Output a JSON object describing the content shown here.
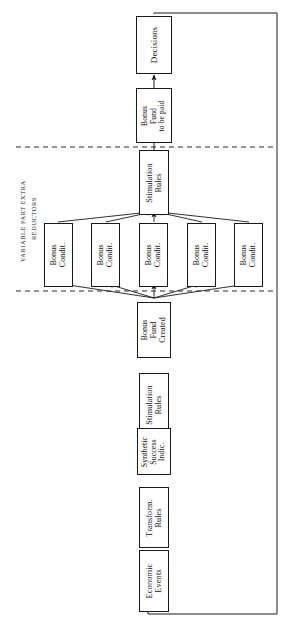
{
  "figure": {
    "orientation": "rotated-90-ccw",
    "background_color": "#ffffff",
    "line_color": "#1a1a1a"
  },
  "section_labels": [
    {
      "name": "variable-part-extra",
      "text": "VARIABLE PART EXTRA"
    },
    {
      "name": "reductors",
      "text": "REDUCTORS"
    }
  ],
  "nodes": {
    "economic_events": {
      "label": "Economic\nEvents",
      "lines": [
        "Economic",
        "Events"
      ]
    },
    "transform_rules": {
      "label": "Transform.\nRules",
      "lines": [
        "Transform.",
        "Rules"
      ]
    },
    "synthetic_success_indic": {
      "label": "Synthetic\nSuccess\nIndic.",
      "lines": [
        "Synthetic",
        "Success",
        "Indic."
      ]
    },
    "stimulation_rules_lower": {
      "label": "Stimulation\nRules",
      "lines": [
        "Stimulation",
        "Rules"
      ]
    },
    "bonus_fund_created": {
      "label": "Bonus\nFund\nCreated",
      "lines": [
        "Bonus",
        "Fund",
        "Created"
      ]
    },
    "bonus_condit_1": {
      "label": "Bonus\nCondit.",
      "lines": [
        "Bonus",
        "Condit."
      ]
    },
    "bonus_condit_2": {
      "label": "Bonus\nCondit.",
      "lines": [
        "Bonus",
        "Condit."
      ]
    },
    "bonus_condit_3": {
      "label": "Bonus\nCondit.",
      "lines": [
        "Bonus",
        "Condit."
      ]
    },
    "bonus_condit_4": {
      "label": "Bonus\nCondit.",
      "lines": [
        "Bonus",
        "Condit."
      ]
    },
    "bonus_condit_5": {
      "label": "Bonus\nCondit.",
      "lines": [
        "Bonus",
        "Condit."
      ]
    },
    "stimulation_rules_upper": {
      "label": "Stimulation\nRules",
      "lines": [
        "Stimulation",
        "Rules"
      ]
    },
    "bonus_fund_to_be_paid": {
      "label": "Bonus\nFund\nto be paid",
      "lines": [
        "Bonus",
        "Fund",
        "to be paid"
      ]
    },
    "decisions": {
      "label": "Decisions",
      "lines": [
        "Decisions"
      ]
    }
  },
  "chart_data": {
    "type": "diagram",
    "title": "",
    "subtype": "flowchart",
    "node_order": [
      "Economic Events",
      "Transform. Rules",
      "Synthetic Success Indic.",
      "Stimulation Rules",
      "Bonus Fund Created",
      "Bonus Condit.",
      "Stimulation Rules",
      "Bonus Fund to be paid",
      "Decisions"
    ],
    "parallel_group": {
      "label": "Bonus Condit.",
      "count": 5
    },
    "edges": [
      {
        "from": "Economic Events",
        "to": "Transform. Rules"
      },
      {
        "from": "Transform. Rules",
        "to": "Synthetic Success Indic."
      },
      {
        "from": "Synthetic Success Indic.",
        "to": "Stimulation Rules"
      },
      {
        "from": "Stimulation Rules",
        "to": "Bonus Fund Created"
      },
      {
        "from": "Bonus Fund Created",
        "to": "Bonus Condit. 1"
      },
      {
        "from": "Bonus Fund Created",
        "to": "Bonus Condit. 2"
      },
      {
        "from": "Bonus Fund Created",
        "to": "Bonus Condit. 3"
      },
      {
        "from": "Bonus Fund Created",
        "to": "Bonus Condit. 4"
      },
      {
        "from": "Bonus Fund Created",
        "to": "Bonus Condit. 5"
      },
      {
        "from": "Bonus Condit. 1",
        "to": "Stimulation Rules (upper)"
      },
      {
        "from": "Bonus Condit. 2",
        "to": "Stimulation Rules (upper)"
      },
      {
        "from": "Bonus Condit. 3",
        "to": "Stimulation Rules (upper)"
      },
      {
        "from": "Bonus Condit. 4",
        "to": "Stimulation Rules (upper)"
      },
      {
        "from": "Bonus Condit. 5",
        "to": "Stimulation Rules (upper)"
      },
      {
        "from": "Stimulation Rules (upper)",
        "to": "Bonus Fund to be paid"
      },
      {
        "from": "Bonus Fund to be paid",
        "to": "Decisions"
      },
      {
        "from": "Decisions",
        "to": "Economic Events",
        "style": "feedback-loop"
      }
    ],
    "dividers": [
      {
        "style": "dashed",
        "position": "between Bonus Fund to be paid and Stimulation Rules (upper)"
      },
      {
        "style": "dashed",
        "position": "between Bonus Condit. row and Bonus Fund Created"
      }
    ]
  }
}
